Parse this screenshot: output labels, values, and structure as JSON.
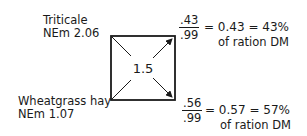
{
  "feeds": {
    "top": {
      "name": "Triticale",
      "nem": "NEm 2.06"
    },
    "bottom": {
      "name": "Wheatgrass hay",
      "nem": "NEm 1.07"
    }
  },
  "square": {
    "center_value": "1.5"
  },
  "results": {
    "top": {
      "numerator": ".43",
      "denominator": ".99",
      "equation": "= 0.43 = 43%",
      "caption": "of ration DM"
    },
    "bottom": {
      "numerator": ".56",
      "denominator": ".99",
      "equation": "= 0.57 = 57%",
      "caption": "of ration DM"
    }
  },
  "colors": {
    "ink": "#1a1a1a",
    "background": "#ffffff"
  }
}
